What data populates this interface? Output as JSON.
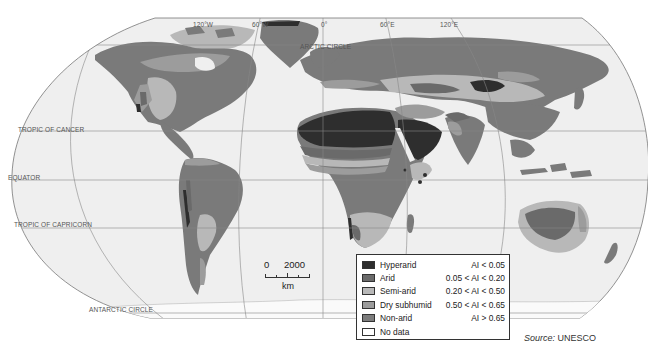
{
  "map": {
    "title": "World aridity zones",
    "graticule_labels": {
      "lon_120w": "120°W",
      "lon_60w": "60°W",
      "lon_0": "0°",
      "lon_60e": "60°E",
      "lon_120e": "120°E"
    },
    "parallels": {
      "arctic": "ARCTIC CIRCLE",
      "cancer": "TROPIC OF CANCER",
      "equator": "EQUATOR",
      "capricorn": "TROPIC OF CAPRICORN",
      "antarctic": "ANTARCTIC CIRCLE"
    },
    "colors": {
      "hyperarid": "#2e2e2e",
      "arid": "#6e6e6e",
      "semi_arid": "#b5b5b5",
      "dry_subhumid": "#9a9a9a",
      "non_arid": "#7a7a7a",
      "no_data": "#ffffff",
      "ocean": "#efefef",
      "ice": "#f4f4f4"
    }
  },
  "legend": {
    "items": [
      {
        "name": "Hyperarid",
        "range": "AI < 0.05",
        "color": "#2e2e2e"
      },
      {
        "name": "Arid",
        "range": "0.05 < AI < 0.20",
        "color": "#6a6a6a"
      },
      {
        "name": "Semi-arid",
        "range": "0.20 < AI < 0.50",
        "color": "#b8b8b8"
      },
      {
        "name": "Dry subhumid",
        "range": "0.50 < AI < 0.65",
        "color": "#9c9c9c"
      },
      {
        "name": "Non-arid",
        "range": "AI > 0.65",
        "color": "#7c7c7c"
      },
      {
        "name": "No data",
        "range": "",
        "color": "#ffffff"
      }
    ]
  },
  "scale_bar": {
    "start": "0",
    "end": "2000",
    "unit": "km"
  },
  "source": {
    "prefix": "Source:",
    "name": "UNESCO"
  }
}
